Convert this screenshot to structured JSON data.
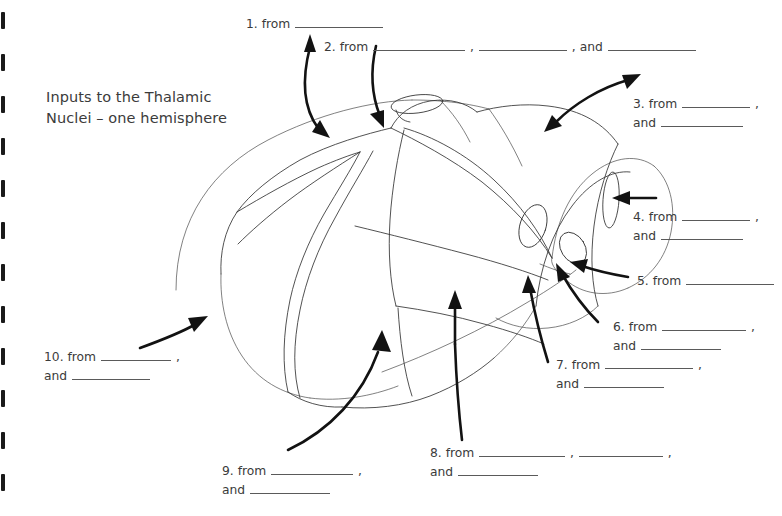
{
  "document": {
    "title": "Inputs to the Thalamic\nNuclei – one hemisphere",
    "page_background": "#ffffff",
    "ink_color": "#333333",
    "text_color": "#3b3b3b",
    "arrow_color": "#121212"
  },
  "binding": {
    "mark_name": "spiral-binding-mark",
    "count": 12,
    "color": "#1a1a1a"
  },
  "labels": [
    {
      "id": "label-1",
      "number": "1.",
      "lines": [
        {
          "parts": [
            {
              "type": "text",
              "value": "1. from "
            },
            {
              "type": "blank",
              "width": 88
            }
          ]
        }
      ]
    },
    {
      "id": "label-2",
      "number": "2.",
      "lines": [
        {
          "parts": [
            {
              "type": "text",
              "value": "2. from "
            },
            {
              "type": "blank",
              "width": 92
            },
            {
              "type": "text",
              "value": " , "
            },
            {
              "type": "blank",
              "width": 88
            },
            {
              "type": "text",
              "value": " , and "
            },
            {
              "type": "blank",
              "width": 88
            }
          ]
        }
      ]
    },
    {
      "id": "label-3",
      "number": "3.",
      "lines": [
        {
          "parts": [
            {
              "type": "text",
              "value": "3. from "
            },
            {
              "type": "blank",
              "width": 68
            },
            {
              "type": "text",
              "value": " ,"
            }
          ]
        },
        {
          "parts": [
            {
              "type": "text",
              "value": "and "
            },
            {
              "type": "blank",
              "width": 82
            }
          ]
        }
      ]
    },
    {
      "id": "label-4",
      "number": "4.",
      "lines": [
        {
          "parts": [
            {
              "type": "text",
              "value": "4. from "
            },
            {
              "type": "blank",
              "width": 68
            },
            {
              "type": "text",
              "value": " ,"
            }
          ]
        },
        {
          "parts": [
            {
              "type": "text",
              "value": "and "
            },
            {
              "type": "blank",
              "width": 82
            }
          ]
        }
      ]
    },
    {
      "id": "label-5",
      "number": "5.",
      "lines": [
        {
          "parts": [
            {
              "type": "text",
              "value": "5. from "
            },
            {
              "type": "blank",
              "width": 88
            }
          ]
        }
      ]
    },
    {
      "id": "label-6",
      "number": "6.",
      "lines": [
        {
          "parts": [
            {
              "type": "text",
              "value": "6. from "
            },
            {
              "type": "blank",
              "width": 84
            },
            {
              "type": "text",
              "value": " ,"
            }
          ]
        },
        {
          "parts": [
            {
              "type": "text",
              "value": "and "
            },
            {
              "type": "blank",
              "width": 80
            }
          ]
        }
      ]
    },
    {
      "id": "label-7",
      "number": "7.",
      "lines": [
        {
          "parts": [
            {
              "type": "text",
              "value": "7. from "
            },
            {
              "type": "blank",
              "width": 88
            },
            {
              "type": "text",
              "value": " ,"
            }
          ]
        },
        {
          "parts": [
            {
              "type": "text",
              "value": "and "
            },
            {
              "type": "blank",
              "width": 80
            }
          ]
        }
      ]
    },
    {
      "id": "label-8",
      "number": "8.",
      "lines": [
        {
          "parts": [
            {
              "type": "text",
              "value": "8. from "
            },
            {
              "type": "blank",
              "width": 86
            },
            {
              "type": "text",
              "value": " , "
            },
            {
              "type": "blank",
              "width": 84
            },
            {
              "type": "text",
              "value": " ,"
            }
          ]
        },
        {
          "parts": [
            {
              "type": "text",
              "value": "and "
            },
            {
              "type": "blank",
              "width": 80
            }
          ]
        }
      ]
    },
    {
      "id": "label-9",
      "number": "9.",
      "lines": [
        {
          "parts": [
            {
              "type": "text",
              "value": "9. from "
            },
            {
              "type": "blank",
              "width": 82
            },
            {
              "type": "text",
              "value": " ,"
            }
          ]
        },
        {
          "parts": [
            {
              "type": "text",
              "value": "and "
            },
            {
              "type": "blank",
              "width": 80
            }
          ]
        }
      ]
    },
    {
      "id": "label-10",
      "number": "10.",
      "lines": [
        {
          "parts": [
            {
              "type": "text",
              "value": "10. from "
            },
            {
              "type": "blank",
              "width": 70
            },
            {
              "type": "text",
              "value": " ,"
            }
          ]
        },
        {
          "parts": [
            {
              "type": "text",
              "value": "and "
            },
            {
              "type": "blank",
              "width": 78
            }
          ]
        }
      ]
    }
  ],
  "diagram": {
    "name": "thalamus-lateral-view",
    "arrow_count": 10
  }
}
